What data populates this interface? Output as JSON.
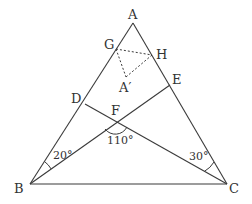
{
  "diagram": {
    "type": "geometry-triangle",
    "colors": {
      "line": "#3a3a3a",
      "text": "#333333",
      "background": "#ffffff"
    },
    "points": {
      "A": {
        "label": "A",
        "x": 133,
        "y": 23
      },
      "B": {
        "label": "B",
        "x": 30,
        "y": 184
      },
      "C": {
        "label": "C",
        "x": 227,
        "y": 184
      },
      "D": {
        "label": "D",
        "x": 85,
        "y": 104
      },
      "E": {
        "label": "E",
        "x": 170,
        "y": 85
      },
      "F": {
        "label": "F",
        "x": 116,
        "y": 121
      },
      "G": {
        "label": "G",
        "x": 116,
        "y": 49
      },
      "H": {
        "label": "H",
        "x": 152,
        "y": 55
      },
      "A_prime": {
        "label": "A′",
        "x": 126,
        "y": 77
      }
    },
    "segments_solid": [
      "AB",
      "AC",
      "BC",
      "BE",
      "CD"
    ],
    "segments_dashed": [
      "GH",
      "GA′",
      "HA′"
    ],
    "angles": {
      "angle_B": {
        "label": "20°",
        "between": "DB, EB (∠ABE)"
      },
      "angle_C": {
        "label": "30°",
        "between": "EC, DC (∠ACD)"
      },
      "angle_F": {
        "label": "110°",
        "between": "∠BFC"
      }
    }
  }
}
